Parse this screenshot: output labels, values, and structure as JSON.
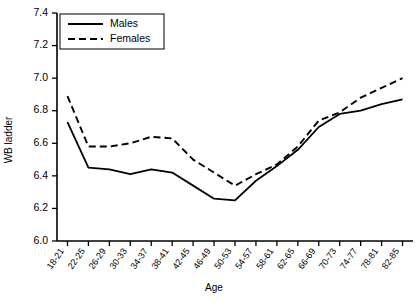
{
  "chart_data": {
    "type": "line",
    "title": "",
    "xlabel": "Age",
    "ylabel": "WB ladder",
    "ylim": [
      6.0,
      7.4
    ],
    "ytick_step": 0.2,
    "yticks": [
      "6.0",
      "6.2",
      "6.4",
      "6.6",
      "6.8",
      "7.0",
      "7.2",
      "7.4"
    ],
    "grid": false,
    "legend_position": "top-left",
    "categories": [
      "18-21",
      "22-25",
      "26-29",
      "30-33",
      "34-37",
      "38-41",
      "42-45",
      "46-49",
      "50-53",
      "54-57",
      "58-61",
      "62-65",
      "66-69",
      "70-73",
      "74-77",
      "78-81",
      "82-85"
    ],
    "series": [
      {
        "name": "Males",
        "style": "solid",
        "values": [
          6.73,
          6.45,
          6.44,
          6.41,
          6.44,
          6.42,
          6.34,
          6.26,
          6.25,
          6.37,
          6.46,
          6.56,
          6.7,
          6.78,
          6.8,
          6.84,
          6.87
        ]
      },
      {
        "name": "Females",
        "style": "dashed",
        "values": [
          6.89,
          6.58,
          6.58,
          6.6,
          6.64,
          6.63,
          6.5,
          6.42,
          6.34,
          6.41,
          6.47,
          6.58,
          6.74,
          6.79,
          6.88,
          6.94,
          7.0
        ]
      }
    ],
    "colors": {
      "axis": "#000000",
      "males": "#000000",
      "females": "#000000",
      "background": "#ffffff"
    }
  }
}
